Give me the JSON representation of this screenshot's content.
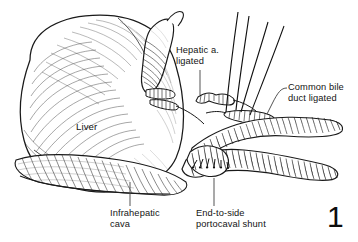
{
  "figure": {
    "number": "1",
    "background_color": "#ffffff",
    "ink_color": "#1a1a1a"
  },
  "labels": {
    "hepatic_artery": "Hepatic a.\nligated",
    "common_bile_duct": "Common bile\nduct ligated",
    "infrahepatic_cava": "Infrahepatic\ncava",
    "portocaval_shunt": "End-to-side\nportocaval shunt",
    "liver": "Liver"
  },
  "anatomy": {
    "liver": "liver",
    "gallbladder": "gallbladder",
    "hepatic_artery_stump": "ligated hepatic artery stump",
    "common_bile_duct_stump": "ligated common bile duct",
    "portal_vein": "portal vein",
    "inferior_vena_cava": "inferior vena cava",
    "anastomosis": "end-to-side anastomosis",
    "suture_threads": "suture threads"
  }
}
